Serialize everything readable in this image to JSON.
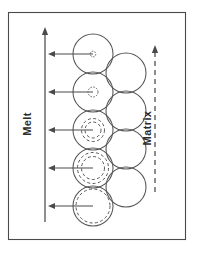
{
  "figure": {
    "frame": {
      "name": "diagram-border",
      "x": 8,
      "y": 12,
      "width": 178,
      "height": 228,
      "color": "#4a4a4a"
    },
    "labels": {
      "melt": "Melt",
      "matrix": "Matrix"
    },
    "axes": [
      {
        "id": "melt-axis",
        "label": "Melt",
        "style": "solid",
        "direction": "up",
        "x": 45,
        "y_top": 27,
        "y_bottom": 222,
        "label_x": 31,
        "label_y": 124
      },
      {
        "id": "matrix-axis",
        "label": "Matrix",
        "style": "dashed",
        "direction": "up",
        "x": 155,
        "y_top": 45,
        "y_bottom": 192,
        "label_x": 151,
        "label_y": 128
      }
    ],
    "flux_arrows": [
      {
        "id": "flux-arrow-1",
        "y": 54,
        "x_start": 93,
        "x_end": 48,
        "direction": "left"
      },
      {
        "id": "flux-arrow-2",
        "y": 92,
        "x_start": 93,
        "x_end": 48,
        "direction": "left"
      },
      {
        "id": "flux-arrow-3",
        "y": 130,
        "x_start": 93,
        "x_end": 48,
        "direction": "left"
      },
      {
        "id": "flux-arrow-4",
        "y": 168,
        "x_start": 93,
        "x_end": 48,
        "direction": "left"
      },
      {
        "id": "flux-arrow-5",
        "y": 206,
        "x_start": 93,
        "x_end": 48,
        "direction": "left"
      }
    ],
    "particles_left": [
      {
        "id": "particle-1",
        "cx": 93,
        "cy": 54,
        "r": 20,
        "cores": [
          2.8
        ],
        "core_style": "small"
      },
      {
        "id": "particle-2",
        "cx": 93,
        "cy": 92,
        "r": 20,
        "cores": [
          5.0
        ],
        "core_style": "small"
      },
      {
        "id": "particle-3",
        "cx": 93,
        "cy": 130,
        "r": 20,
        "cores": [
          8.0,
          11.5
        ],
        "core_style": "normal"
      },
      {
        "id": "particle-4",
        "cx": 93,
        "cy": 168,
        "r": 20,
        "cores": [
          11.5,
          15.5
        ],
        "core_style": "normal"
      },
      {
        "id": "particle-5",
        "cx": 93,
        "cy": 206,
        "r": 20,
        "cores": [
          17.0
        ],
        "core_style": "normal"
      }
    ],
    "particles_right": [
      {
        "id": "matrix-particle-1",
        "cx": 126,
        "cy": 73,
        "r": 20
      },
      {
        "id": "matrix-particle-2",
        "cx": 126,
        "cy": 111,
        "r": 20
      },
      {
        "id": "matrix-particle-3",
        "cx": 126,
        "cy": 149,
        "r": 20
      },
      {
        "id": "matrix-particle-4",
        "cx": 126,
        "cy": 187,
        "r": 20
      }
    ]
  }
}
